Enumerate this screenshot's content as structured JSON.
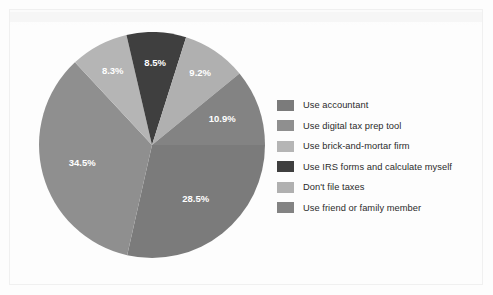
{
  "chart_data": {
    "type": "pie",
    "title": "",
    "subtitle": "",
    "xlabel": "",
    "ylabel": "",
    "legend_position": "right",
    "grid": false,
    "categories": [
      "Use accountant",
      "Use digital tax prep tool",
      "Use brick-and-mortar firm",
      "Use IRS forms and calculate myself",
      "Don't file taxes",
      "Use friend or family member"
    ],
    "values": [
      28.5,
      34.5,
      8.3,
      8.5,
      9.2,
      10.9
    ],
    "value_labels": [
      "28.5%",
      "34.5%",
      "8.3%",
      "8.5%",
      "9.2%",
      "10.9%"
    ],
    "colors": [
      "#7b7b7b",
      "#8f8f8f",
      "#b5b5b5",
      "#3f3f3f",
      "#b0b0b0",
      "#838383"
    ],
    "units": "percent",
    "start_angle_deg": 0,
    "direction": "clockwise",
    "slices": [
      {
        "label": "Use accountant",
        "value": 28.5,
        "value_label": "28.5%",
        "color": "#7b7b7b"
      },
      {
        "label": "Use digital tax prep tool",
        "value": 34.5,
        "value_label": "34.5%",
        "color": "#8f8f8f"
      },
      {
        "label": "Use brick-and-mortar firm",
        "value": 8.3,
        "value_label": "8.3%",
        "color": "#b5b5b5"
      },
      {
        "label": "Use IRS forms and calculate myself",
        "value": 8.5,
        "value_label": "8.5%",
        "color": "#3f3f3f"
      },
      {
        "label": "Don't file taxes",
        "value": 9.2,
        "value_label": "9.2%",
        "color": "#b0b0b0"
      },
      {
        "label": "Use friend or family member",
        "value": 10.9,
        "value_label": "10.9%",
        "color": "#838383"
      }
    ]
  },
  "legend": {
    "items": [
      {
        "label": "Use accountant",
        "color": "#7b7b7b"
      },
      {
        "label": "Use digital tax prep tool",
        "color": "#8f8f8f"
      },
      {
        "label": "Use brick-and-mortar firm",
        "color": "#b5b5b5"
      },
      {
        "label": "Use IRS forms and calculate myself",
        "color": "#3f3f3f"
      },
      {
        "label": "Don't file taxes",
        "color": "#b0b0b0"
      },
      {
        "label": "Use friend or family member",
        "color": "#838383"
      }
    ]
  }
}
